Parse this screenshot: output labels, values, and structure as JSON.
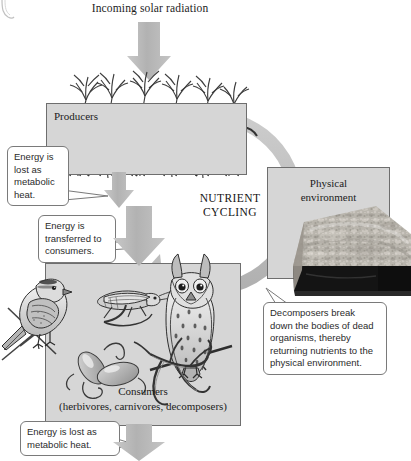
{
  "figure": {
    "type": "ecology-energy-flow-nutrient-cycling-diagram",
    "title": "Incoming solar radiation",
    "center_label_line1": "NUTRIENT",
    "center_label_line2": "CYCLING"
  },
  "boxes": {
    "producers": {
      "label": "Producers",
      "illustration": "grass-plants"
    },
    "physical_environment": {
      "label_line1": "Physical",
      "label_line2": "environment",
      "illustration": "soil-rock-block-cross-section"
    },
    "consumers": {
      "label": "Consumers",
      "sublabel": "(herbivores, carnivores, decomposers)",
      "illustrations": [
        "sparrow-bird",
        "grasshopper",
        "owl",
        "bacteria",
        "fungi"
      ]
    }
  },
  "callouts": [
    {
      "id": "producer-heat",
      "text": "Energy is lost as metabolic heat."
    },
    {
      "id": "energy-transfer",
      "text": "Energy is transferred to consumers."
    },
    {
      "id": "decomposers",
      "text": "Decomposers break down the bodies of dead organisms, thereby returning nutrients to the physical environment."
    },
    {
      "id": "consumer-heat",
      "text": "Energy is lost as metabolic heat."
    }
  ],
  "arrows": [
    {
      "name": "solar-radiation-arrow",
      "direction": "down",
      "meaning": "incoming solar radiation into producers"
    },
    {
      "name": "producer-heat-arrow",
      "direction": "down",
      "meaning": "metabolic heat lost from producers"
    },
    {
      "name": "energy-transfer-arrow",
      "direction": "down",
      "meaning": "energy transferred to consumers"
    },
    {
      "name": "consumer-heat-arrow",
      "direction": "down",
      "meaning": "metabolic heat lost from consumers"
    },
    {
      "name": "nutrient-cycling-arrow",
      "direction": "clockwise-circular",
      "meaning": "nutrients cycle among producers, consumers and physical environment"
    }
  ],
  "colors": {
    "panel_fill": "#d6d6d6",
    "panel_border": "#6e6e6e",
    "arrow_gray": "#b4b4b4",
    "cycle_gray": "#bdbdbd",
    "callout_border": "#7a7a7a",
    "text": "#1c1c1c",
    "soil_dark": "#1a1a1a",
    "background": "#ffffff"
  }
}
